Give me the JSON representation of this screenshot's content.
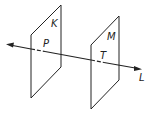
{
  "diagram": {
    "planes": [
      {
        "label": "K",
        "point_label": "P"
      },
      {
        "label": "M",
        "point_label": "T"
      }
    ],
    "line_label": "L",
    "colors": {
      "stroke": "#222222",
      "background": "#ffffff"
    }
  }
}
